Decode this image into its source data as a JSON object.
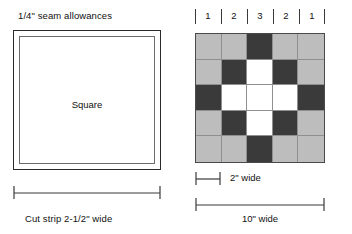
{
  "left_diagram": {
    "top_caption": "1/4\" seam allowances",
    "square_label": "Square",
    "bottom_caption": "Cut strip 2-1/2\" wide"
  },
  "right_diagram": {
    "column_numbers": [
      "1",
      "2",
      "3",
      "2",
      "1"
    ],
    "cell_width_label": "2\" wide",
    "block_width_label": "10\" wide",
    "grid": [
      [
        "light",
        "light",
        "dark",
        "light",
        "light"
      ],
      [
        "light",
        "dark",
        "white",
        "dark",
        "light"
      ],
      [
        "dark",
        "white",
        "white",
        "white",
        "dark"
      ],
      [
        "light",
        "dark",
        "white",
        "dark",
        "light"
      ],
      [
        "light",
        "light",
        "dark",
        "light",
        "light"
      ]
    ],
    "colors": {
      "light": "#bdbdbd",
      "dark": "#3a3a3a",
      "white": "#ffffff",
      "grid_line": "#8f8f8f",
      "outline": "#4a4a4a"
    }
  }
}
